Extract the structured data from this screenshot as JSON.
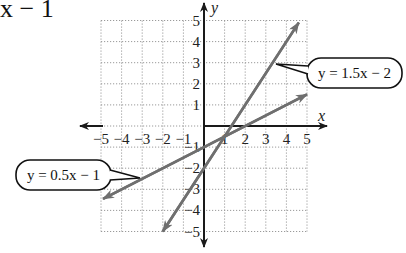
{
  "top_fragment": "x − 1",
  "chart_data": {
    "type": "line",
    "title": "",
    "xlabel": "x",
    "ylabel": "y",
    "xlim": [
      -5,
      5
    ],
    "ylim": [
      -5,
      5
    ],
    "grid": true,
    "x_ticks": [
      "−5",
      "−4",
      "−3",
      "−2",
      "−1",
      "1",
      "2",
      "3",
      "4",
      "5"
    ],
    "y_ticks": [
      "5",
      "4",
      "3",
      "2",
      "1",
      "−1",
      "−2",
      "−3",
      "−4",
      "−5"
    ],
    "series": [
      {
        "name": "y = 1.5x − 2",
        "slope": 1.5,
        "intercept": -2,
        "x": [
          -2,
          4.6
        ],
        "y": [
          -5,
          4.9
        ],
        "color": "#6f6f6f"
      },
      {
        "name": "y = 0.5x − 1",
        "slope": 0.5,
        "intercept": -1,
        "x": [
          -4.9,
          5
        ],
        "y": [
          -3.45,
          1.5
        ],
        "color": "#6f6f6f"
      }
    ],
    "annotations": [
      {
        "text": "y = 1.5x − 2",
        "type": "callout",
        "position": "right"
      },
      {
        "text": "y = 0.5x − 1",
        "type": "callout",
        "position": "left"
      }
    ]
  },
  "colors": {
    "axis": "#1a1a1a",
    "line": "#6f6f6f",
    "grid": "#9a9a9a"
  }
}
